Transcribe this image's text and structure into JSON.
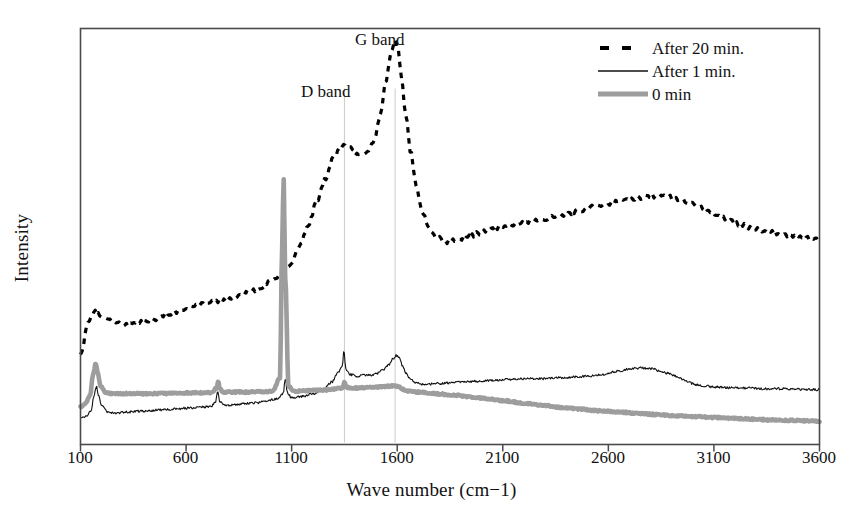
{
  "chart_data": {
    "type": "line",
    "title": "",
    "xlabel": "Wave number (cm−1)",
    "ylabel": "Intensity",
    "xlim": [
      100,
      3600
    ],
    "ylim": [
      0,
      1
    ],
    "xticks": [
      100,
      600,
      1100,
      1600,
      2100,
      2600,
      3100,
      3600
    ],
    "xticklabels": [
      "100",
      "600",
      "1100",
      "1600",
      "2100",
      "2600",
      "3100",
      "3600"
    ],
    "yticks": [],
    "yticklabels": [],
    "grid": false,
    "legend_position": "top-right",
    "annotations": [
      {
        "text": "D band",
        "x": 1350,
        "note": "label above faint vertical guide line at D band"
      },
      {
        "text": "G band",
        "x": 1590,
        "note": "label above faint vertical guide line at G band"
      }
    ],
    "guide_lines": [
      {
        "x": 1350,
        "color": "#cccccc"
      },
      {
        "x": 1590,
        "color": "#cccccc"
      }
    ],
    "series": [
      {
        "name": "After 20 min.",
        "style": "dashed",
        "color": "#000000",
        "linewidth": 3.2,
        "x": [
          100,
          140,
          170,
          200,
          240,
          280,
          320,
          360,
          400,
          450,
          500,
          550,
          600,
          650,
          700,
          750,
          800,
          850,
          900,
          950,
          1000,
          1040,
          1060,
          1080,
          1100,
          1140,
          1180,
          1220,
          1260,
          1300,
          1330,
          1350,
          1380,
          1400,
          1430,
          1460,
          1490,
          1520,
          1545,
          1570,
          1590,
          1605,
          1620,
          1640,
          1665,
          1690,
          1720,
          1750,
          1790,
          1830,
          1880,
          1930,
          1990,
          2050,
          2110,
          2170,
          2240,
          2300,
          2360,
          2420,
          2480,
          2540,
          2600,
          2660,
          2720,
          2780,
          2830,
          2870,
          2900,
          2930,
          2970,
          3010,
          3060,
          3110,
          3170,
          3230,
          3290,
          3350,
          3420,
          3490,
          3550,
          3600
        ],
        "y": [
          0.215,
          0.3,
          0.318,
          0.308,
          0.298,
          0.29,
          0.288,
          0.292,
          0.296,
          0.302,
          0.31,
          0.318,
          0.328,
          0.336,
          0.34,
          0.344,
          0.35,
          0.358,
          0.366,
          0.376,
          0.392,
          0.405,
          0.412,
          0.425,
          0.44,
          0.48,
          0.53,
          0.585,
          0.64,
          0.69,
          0.712,
          0.718,
          0.712,
          0.7,
          0.698,
          0.706,
          0.73,
          0.79,
          0.87,
          0.94,
          0.975,
          0.95,
          0.88,
          0.79,
          0.7,
          0.62,
          0.56,
          0.52,
          0.498,
          0.488,
          0.49,
          0.498,
          0.508,
          0.518,
          0.524,
          0.53,
          0.538,
          0.543,
          0.548,
          0.556,
          0.564,
          0.572,
          0.578,
          0.586,
          0.592,
          0.596,
          0.598,
          0.597,
          0.594,
          0.59,
          0.584,
          0.576,
          0.566,
          0.554,
          0.54,
          0.528,
          0.518,
          0.512,
          0.506,
          0.5,
          0.496,
          0.494
        ]
      },
      {
        "name": "After 1 min.",
        "style": "solid-thin",
        "color": "#111111",
        "linewidth": 1.1,
        "x": [
          100,
          130,
          150,
          165,
          175,
          185,
          200,
          230,
          270,
          320,
          380,
          440,
          500,
          560,
          620,
          680,
          720,
          740,
          750,
          760,
          780,
          830,
          880,
          930,
          980,
          1030,
          1060,
          1070,
          1080,
          1100,
          1150,
          1200,
          1250,
          1290,
          1320,
          1340,
          1348,
          1352,
          1360,
          1380,
          1410,
          1440,
          1470,
          1500,
          1530,
          1560,
          1580,
          1595,
          1610,
          1625,
          1640,
          1660,
          1690,
          1730,
          1780,
          1840,
          1900,
          1970,
          2040,
          2110,
          2190,
          2270,
          2350,
          2430,
          2500,
          2570,
          2640,
          2700,
          2760,
          2810,
          2850,
          2890,
          2930,
          2970,
          3010,
          3060,
          3120,
          3190,
          3260,
          3330,
          3410,
          3490,
          3550,
          3600
        ],
        "y": [
          0.062,
          0.07,
          0.082,
          0.118,
          0.14,
          0.12,
          0.092,
          0.078,
          0.076,
          0.078,
          0.08,
          0.082,
          0.084,
          0.086,
          0.088,
          0.09,
          0.092,
          0.104,
          0.128,
          0.104,
          0.094,
          0.096,
          0.098,
          0.1,
          0.104,
          0.11,
          0.122,
          0.158,
          0.124,
          0.112,
          0.116,
          0.122,
          0.132,
          0.15,
          0.172,
          0.186,
          0.232,
          0.198,
          0.176,
          0.168,
          0.164,
          0.168,
          0.166,
          0.17,
          0.178,
          0.192,
          0.206,
          0.214,
          0.208,
          0.19,
          0.172,
          0.158,
          0.148,
          0.144,
          0.146,
          0.148,
          0.15,
          0.152,
          0.154,
          0.156,
          0.158,
          0.158,
          0.16,
          0.162,
          0.164,
          0.168,
          0.176,
          0.182,
          0.184,
          0.182,
          0.176,
          0.17,
          0.162,
          0.152,
          0.144,
          0.14,
          0.138,
          0.136,
          0.136,
          0.134,
          0.134,
          0.133,
          0.132,
          0.132
        ]
      },
      {
        "name": "0 min",
        "style": "solid-thick",
        "color": "#9d9d9d",
        "linewidth": 4.6,
        "x": [
          100,
          125,
          145,
          160,
          172,
          182,
          195,
          220,
          260,
          310,
          370,
          430,
          490,
          550,
          610,
          670,
          720,
          745,
          752,
          760,
          775,
          820,
          870,
          920,
          970,
          1010,
          1045,
          1055,
          1062,
          1070,
          1085,
          1110,
          1150,
          1200,
          1250,
          1300,
          1340,
          1350,
          1360,
          1400,
          1450,
          1500,
          1550,
          1590,
          1610,
          1630,
          1660,
          1700,
          1750,
          1810,
          1880,
          1950,
          2030,
          2110,
          2200,
          2290,
          2380,
          2470,
          2560,
          2650,
          2740,
          2830,
          2920,
          3010,
          3100,
          3190,
          3280,
          3370,
          3460,
          3540,
          3600
        ],
        "y": [
          0.09,
          0.1,
          0.118,
          0.168,
          0.196,
          0.172,
          0.14,
          0.124,
          0.122,
          0.122,
          0.122,
          0.122,
          0.123,
          0.123,
          0.124,
          0.124,
          0.125,
          0.136,
          0.152,
          0.134,
          0.126,
          0.126,
          0.126,
          0.127,
          0.127,
          0.128,
          0.16,
          0.48,
          0.64,
          0.4,
          0.14,
          0.128,
          0.129,
          0.13,
          0.131,
          0.133,
          0.136,
          0.15,
          0.137,
          0.136,
          0.137,
          0.138,
          0.14,
          0.141,
          0.138,
          0.132,
          0.128,
          0.126,
          0.124,
          0.121,
          0.118,
          0.114,
          0.11,
          0.105,
          0.099,
          0.094,
          0.089,
          0.085,
          0.081,
          0.078,
          0.075,
          0.072,
          0.069,
          0.067,
          0.065,
          0.063,
          0.061,
          0.059,
          0.058,
          0.057,
          0.056
        ]
      }
    ]
  },
  "legend": {
    "items": [
      {
        "label": "After 20 min.",
        "style": "dashed",
        "color": "#000000"
      },
      {
        "label": "After 1 min.",
        "style": "solid-thin",
        "color": "#111111"
      },
      {
        "label": "0 min",
        "style": "solid-thick",
        "color": "#9d9d9d"
      }
    ]
  },
  "labels": {
    "d_band": "D band",
    "g_band": "G band"
  },
  "axes": {
    "x_title": "Wave number (cm−1)",
    "y_title": "Intensity",
    "x_tick_0": "100",
    "x_tick_1": "600",
    "x_tick_2": "1100",
    "x_tick_3": "1600",
    "x_tick_4": "2100",
    "x_tick_5": "2600",
    "x_tick_6": "3100",
    "x_tick_7": "3600"
  },
  "colors": {
    "frame": "#4a4a4a",
    "gray_series": "#9d9d9d",
    "black_series": "#000000",
    "guide_line": "#cfcfcf",
    "background": "#ffffff"
  }
}
